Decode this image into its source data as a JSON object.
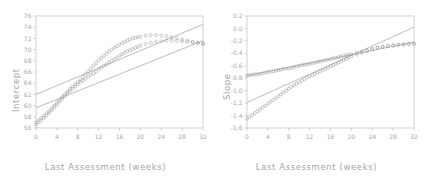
{
  "figure": {
    "background": "#ffffff",
    "axis_color": "#bfbfbf",
    "text_color": "#a6a6a6",
    "marker_color": "#9e9e9e",
    "line_color": "#8f8f8f"
  },
  "panels": [
    {
      "name": "intercept-panel",
      "ylabel": "Intercept",
      "xlabel": "Last Assessment (weeks)",
      "xticks": [
        "0",
        "4",
        "8",
        "12",
        "16",
        "20",
        "24",
        "28",
        "32"
      ],
      "yticks": [
        "56",
        "58",
        "60",
        "62",
        "64",
        "66",
        "68",
        "70",
        "72",
        "74",
        "76"
      ]
    },
    {
      "name": "slope-panel",
      "ylabel": "Slope",
      "xlabel": "Last Assessment (weeks)",
      "xticks": [
        "0",
        "4",
        "8",
        "12",
        "16",
        "20",
        "24",
        "28",
        "32"
      ],
      "yticks": [
        "-1.6",
        "-1.4",
        "-1.2",
        "-1.0",
        "-0.8",
        "-0.6",
        "-0.4",
        "-0.2",
        "0.0",
        "0.2"
      ]
    }
  ],
  "chart_data": [
    {
      "type": "scatter",
      "title": "",
      "xlabel": "Last Assessment (weeks)",
      "ylabel": "Intercept",
      "xlim": [
        0,
        32
      ],
      "ylim": [
        56,
        76
      ],
      "xticks": [
        0,
        4,
        8,
        12,
        16,
        20,
        24,
        28,
        32
      ],
      "yticks": [
        56,
        58,
        60,
        62,
        64,
        66,
        68,
        70,
        72,
        74,
        76
      ],
      "grid": false,
      "legend": "none",
      "series": [
        {
          "name": "upper-marker-curve",
          "style": "open-circle-markers",
          "x": [
            0,
            0.5,
            1,
            1.5,
            2,
            2.5,
            3,
            3.5,
            4,
            4.5,
            5,
            5.5,
            6,
            6.5,
            7,
            7.5,
            8,
            8.5,
            9,
            9.5,
            10,
            10.5,
            11,
            11.5,
            12,
            12.5,
            13,
            13.5,
            14,
            14.5,
            15,
            15.5,
            16,
            16.5,
            17,
            17.5,
            18,
            18.5,
            19,
            19.5,
            20,
            21,
            22,
            23,
            24,
            25,
            26,
            27,
            28,
            29,
            30,
            31,
            32
          ],
          "y": [
            57.0,
            57.4,
            57.8,
            58.2,
            58.6,
            59.0,
            59.5,
            60.0,
            60.5,
            61.0,
            61.5,
            62.0,
            62.5,
            63.0,
            63.4,
            63.8,
            64.2,
            64.6,
            65.1,
            65.6,
            66.1,
            66.6,
            67.1,
            67.6,
            68.1,
            68.5,
            68.9,
            69.3,
            69.7,
            70.0,
            70.3,
            70.6,
            70.9,
            71.2,
            71.4,
            71.6,
            71.8,
            72.0,
            72.1,
            72.2,
            72.3,
            72.5,
            72.6,
            72.6,
            72.5,
            72.4,
            72.2,
            72.0,
            71.8,
            71.6,
            71.4,
            71.2,
            71.0
          ]
        },
        {
          "name": "lower-marker-curve",
          "style": "open-circle-markers",
          "x": [
            0,
            0.5,
            1,
            1.5,
            2,
            2.5,
            3,
            3.5,
            4,
            4.5,
            5,
            5.5,
            6,
            6.5,
            7,
            7.5,
            8,
            8.5,
            9,
            9.5,
            10,
            10.5,
            11,
            11.5,
            12,
            12.5,
            13,
            13.5,
            14,
            14.5,
            15,
            15.5,
            16,
            16.5,
            17,
            17.5,
            18,
            18.5,
            19,
            19.5,
            20,
            21,
            22,
            23,
            24,
            25,
            26,
            27,
            28,
            29,
            30,
            31,
            32
          ],
          "y": [
            56.6,
            57.0,
            57.4,
            57.8,
            58.2,
            58.7,
            59.2,
            59.7,
            60.2,
            60.7,
            61.2,
            61.7,
            62.2,
            62.6,
            63.0,
            63.4,
            63.8,
            64.2,
            64.5,
            64.8,
            65.2,
            65.5,
            65.8,
            66.1,
            66.5,
            66.8,
            67.1,
            67.4,
            67.7,
            68.0,
            68.3,
            68.6,
            68.9,
            69.2,
            69.5,
            69.7,
            69.9,
            70.1,
            70.3,
            70.5,
            70.7,
            71.0,
            71.2,
            71.4,
            71.5,
            71.6,
            71.6,
            71.6,
            71.5,
            71.4,
            71.3,
            71.2,
            71.1
          ]
        },
        {
          "name": "upper-regression-line",
          "style": "solid-line",
          "x": [
            0,
            32
          ],
          "y": [
            62.0,
            74.5
          ]
        },
        {
          "name": "lower-regression-line",
          "style": "solid-line",
          "x": [
            0,
            32
          ],
          "y": [
            59.6,
            71.6
          ]
        }
      ]
    },
    {
      "type": "scatter",
      "title": "",
      "xlabel": "Last Assessment (weeks)",
      "ylabel": "Slope",
      "xlim": [
        0,
        32
      ],
      "ylim": [
        -1.6,
        0.2
      ],
      "xticks": [
        0,
        4,
        8,
        12,
        16,
        20,
        24,
        28,
        32
      ],
      "yticks": [
        -1.6,
        -1.4,
        -1.2,
        -1.0,
        -0.8,
        -0.6,
        -0.4,
        -0.2,
        0.0,
        0.2
      ],
      "grid": false,
      "legend": "none",
      "series": [
        {
          "name": "flat-marker-curve",
          "style": "open-circle-markers",
          "x": [
            0,
            0.5,
            1,
            1.5,
            2,
            2.5,
            3,
            3.5,
            4,
            4.5,
            5,
            5.5,
            6,
            6.5,
            7,
            7.5,
            8,
            8.5,
            9,
            9.5,
            10,
            10.5,
            11,
            11.5,
            12,
            12.5,
            13,
            13.5,
            14,
            14.5,
            15,
            15.5,
            16,
            16.5,
            17,
            17.5,
            18,
            18.5,
            19,
            19.5,
            20,
            21,
            22,
            23,
            24,
            25,
            26,
            27,
            28,
            29,
            30,
            31,
            32
          ],
          "y": [
            -0.76,
            -0.75,
            -0.745,
            -0.74,
            -0.735,
            -0.73,
            -0.72,
            -0.71,
            -0.7,
            -0.695,
            -0.69,
            -0.68,
            -0.67,
            -0.66,
            -0.65,
            -0.645,
            -0.64,
            -0.63,
            -0.62,
            -0.61,
            -0.6,
            -0.59,
            -0.58,
            -0.575,
            -0.57,
            -0.56,
            -0.55,
            -0.54,
            -0.53,
            -0.52,
            -0.51,
            -0.5,
            -0.49,
            -0.48,
            -0.47,
            -0.46,
            -0.45,
            -0.44,
            -0.43,
            -0.42,
            -0.41,
            -0.39,
            -0.37,
            -0.35,
            -0.33,
            -0.31,
            -0.3,
            -0.285,
            -0.275,
            -0.265,
            -0.26,
            -0.25,
            -0.245
          ]
        },
        {
          "name": "steep-marker-curve",
          "style": "open-circle-markers",
          "x": [
            0,
            0.5,
            1,
            1.5,
            2,
            2.5,
            3,
            3.5,
            4,
            4.5,
            5,
            5.5,
            6,
            6.5,
            7,
            7.5,
            8,
            8.5,
            9,
            9.5,
            10,
            10.5,
            11,
            11.5,
            12,
            12.5,
            13,
            13.5,
            14,
            14.5,
            15,
            15.5,
            16,
            16.5,
            17,
            17.5,
            18,
            18.5,
            19,
            19.5,
            20,
            21,
            22,
            23,
            24,
            25,
            26,
            27,
            28,
            29,
            30,
            31,
            32
          ],
          "y": [
            -1.45,
            -1.42,
            -1.39,
            -1.36,
            -1.33,
            -1.3,
            -1.27,
            -1.24,
            -1.21,
            -1.18,
            -1.15,
            -1.12,
            -1.09,
            -1.06,
            -1.03,
            -1.0,
            -0.97,
            -0.94,
            -0.915,
            -0.89,
            -0.865,
            -0.84,
            -0.815,
            -0.79,
            -0.77,
            -0.75,
            -0.73,
            -0.71,
            -0.69,
            -0.67,
            -0.65,
            -0.63,
            -0.61,
            -0.59,
            -0.57,
            -0.55,
            -0.53,
            -0.51,
            -0.49,
            -0.47,
            -0.45,
            -0.42,
            -0.39,
            -0.36,
            -0.335,
            -0.31,
            -0.29,
            -0.28,
            -0.27,
            -0.26,
            -0.255,
            -0.25,
            -0.245
          ]
        },
        {
          "name": "upper-regression-line",
          "style": "solid-line",
          "x": [
            0,
            32
          ],
          "y": [
            -0.76,
            -0.22
          ]
        },
        {
          "name": "lower-regression-line",
          "style": "solid-line",
          "x": [
            0,
            32
          ],
          "y": [
            -1.19,
            0.02
          ]
        }
      ]
    }
  ]
}
